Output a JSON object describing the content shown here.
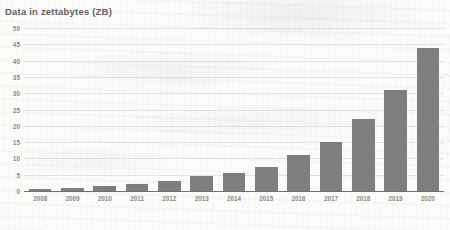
{
  "chart": {
    "title": "Data in zettabytes (ZB)",
    "bar_color": "#7e7e7e",
    "gridline_color": "#e3e3e1",
    "axis_color": "#6f6f6f",
    "label_color": "#8a8a8a",
    "title_color": "#5e5e5e"
  },
  "chart_data": {
    "type": "bar",
    "title": "Data in zettabytes (ZB)",
    "xlabel": "",
    "ylabel": "Data in zettabytes (ZB)",
    "ylim": [
      0,
      50
    ],
    "yticks": [
      0,
      5,
      10,
      15,
      20,
      25,
      30,
      35,
      40,
      45,
      50
    ],
    "ytick_labels": [
      "0",
      "5",
      "10",
      "15",
      "20",
      "25",
      "30",
      "35",
      "40",
      "45",
      "50"
    ],
    "grid": true,
    "legend": false,
    "categories": [
      "2008",
      "2009",
      "2010",
      "2011",
      "2012",
      "2013",
      "2014",
      "2015",
      "2016",
      "2017",
      "2018",
      "2019",
      "2020"
    ],
    "values": [
      0.5,
      1,
      1.5,
      2,
      3,
      4.5,
      5.5,
      7.5,
      11,
      15,
      22,
      31,
      44
    ]
  }
}
